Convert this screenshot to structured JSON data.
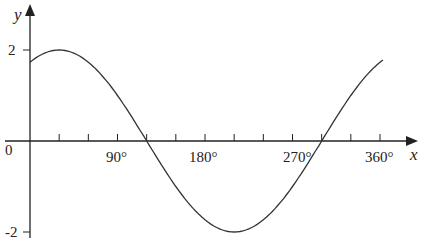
{
  "chart_data": {
    "type": "line",
    "title": "",
    "xlabel": "x",
    "ylabel": "y",
    "function": "y = 2 sin(x + 60°)",
    "x_ticks": [
      "90°",
      "180°",
      "270°",
      "360°"
    ],
    "y_ticks": [
      "2",
      "-2"
    ],
    "origin_label": "0",
    "xlim": [
      0,
      360
    ],
    "ylim": [
      -2,
      2
    ],
    "x": [
      0,
      30,
      60,
      90,
      120,
      150,
      180,
      210,
      240,
      270,
      300,
      330,
      360
    ],
    "series": [
      {
        "name": "curve",
        "values": [
          1.73,
          2,
          1.73,
          1,
          0,
          -1,
          -1.73,
          -2,
          -1.73,
          -1,
          0,
          1,
          1.73
        ]
      }
    ],
    "grid": false
  }
}
